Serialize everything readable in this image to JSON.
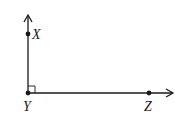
{
  "diagram": {
    "type": "right-angle",
    "stroke_color": "#1a1a1a",
    "background": "#ffffff",
    "points": [
      {
        "id": "X",
        "label": "X",
        "x": 28,
        "y": 34
      },
      {
        "id": "Y",
        "label": "Y",
        "x": 28,
        "y": 93
      },
      {
        "id": "Z",
        "label": "Z",
        "x": 149,
        "y": 93
      }
    ],
    "rays": [
      {
        "from": "Y",
        "through": "X",
        "label": "ray YX"
      },
      {
        "from": "Y",
        "through": "Z",
        "label": "ray YZ"
      }
    ],
    "angle_marker": {
      "vertex": "Y",
      "type": "right-angle-square"
    }
  }
}
